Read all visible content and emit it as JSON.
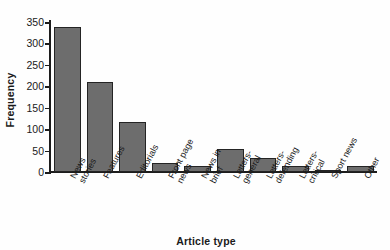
{
  "chart_data": {
    "type": "bar",
    "title": "",
    "xlabel": "Article type",
    "ylabel": "Frequency",
    "categories": [
      "News\nstories",
      "Features",
      "Editorials",
      "Front page\nnews",
      "News in\nbrief",
      "Letters-\ngeneral",
      "Letters-\ndefending",
      "Letters-\ncritical",
      "Sport news",
      "Other"
    ],
    "values": [
      338,
      211,
      117,
      22,
      15,
      53,
      32,
      13,
      3,
      14
    ],
    "ylim": [
      0,
      350
    ],
    "yticks": [
      0,
      50,
      100,
      150,
      200,
      250,
      300,
      350
    ],
    "ytick_labels": [
      "0",
      "50",
      "100",
      "150",
      "200",
      "250",
      "300",
      "350"
    ],
    "grid": false,
    "legend": false,
    "bar_color": "#6d6d6d",
    "bar_edge_color": "#242424",
    "axis_color": "#1c1c1c",
    "background": "#fefefe"
  }
}
